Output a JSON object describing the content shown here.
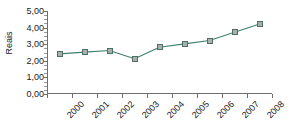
{
  "chart_data": {
    "type": "line",
    "title": "",
    "subtitle": "",
    "xlabel": "",
    "ylabel": "Reais",
    "categories": [
      "2000",
      "2001",
      "2002",
      "2003",
      "2004",
      "2005",
      "2006",
      "2007",
      "2008"
    ],
    "values": [
      2.42,
      2.52,
      2.62,
      2.12,
      2.82,
      3.02,
      3.22,
      3.72,
      4.22
    ],
    "series": [
      {
        "name": "Reais",
        "values": [
          2.42,
          2.52,
          2.62,
          2.12,
          2.82,
          3.02,
          3.22,
          3.72,
          4.22
        ]
      }
    ],
    "ylim": [
      0,
      5
    ],
    "ytick_labels": [
      "5,00",
      "4,00",
      "3,00",
      "2,00",
      "1,00",
      "0,00"
    ],
    "ytick_values": [
      5,
      4,
      3,
      2,
      1,
      0
    ],
    "grid": false,
    "legend": false,
    "legend_position": "none",
    "decimal_separator": ",",
    "xtick_rotation": -45,
    "colors": {
      "line": "#3f7f6f",
      "marker_fill": "#a8b0ad",
      "marker_border": "#4f6f66",
      "axis": "#6e6e6e",
      "text": "#1a1a1a",
      "background": "#ffffff"
    }
  }
}
